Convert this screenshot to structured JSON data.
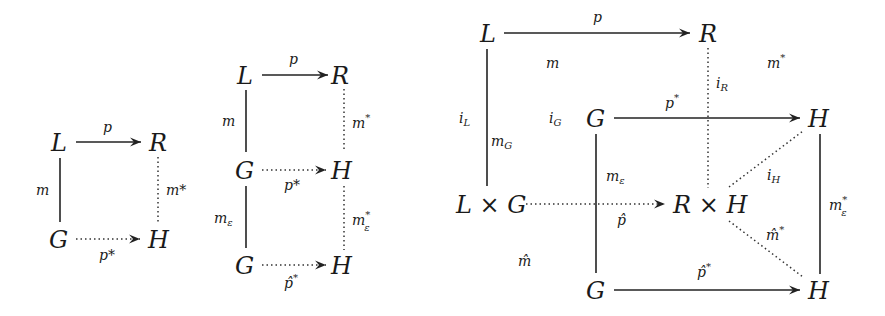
{
  "diagrams": [
    {
      "name": "pushout-square",
      "nodes": {
        "L": "L",
        "R": "R",
        "G": "G",
        "H": "H"
      },
      "labels": {
        "p": "p",
        "m": "m",
        "m_star": "m*",
        "p_star": "p*"
      }
    },
    {
      "name": "double-pushout",
      "nodes": {
        "L": "L",
        "R": "R",
        "G1": "G",
        "H1": "H",
        "G2": "G",
        "H2": "H"
      },
      "labels": {
        "p": "p",
        "m": "m",
        "m_star": "m",
        "m_star_sup": "*",
        "p_star": "p*",
        "m_eps": "m",
        "m_eps_sub": "ε",
        "m_eps_star": "m",
        "m_eps_star_sup": "*",
        "m_eps_star_sub": "ε",
        "p_hat_star": "p̂",
        "p_hat_star_sup": "*"
      }
    },
    {
      "name": "product-cube",
      "nodes": {
        "L": "L",
        "R": "R",
        "G_top": "G",
        "H_top": "H",
        "LxG": "L × G",
        "RxH": "R × H",
        "G_bot": "G",
        "H_bot": "H"
      },
      "labels": {
        "p": "p",
        "m": "m",
        "m_star": "m",
        "m_star_sup": "*",
        "i_L": "i",
        "i_L_sub": "L",
        "m_G": "m",
        "m_G_sub": "G",
        "i_G": "i",
        "i_G_sub": "G",
        "i_R": "i",
        "i_R_sub": "R",
        "p_star": "p",
        "p_star_sup": "*",
        "m_eps": "m",
        "m_eps_sub": "ε",
        "p_hat": "p̂",
        "i_H": "i",
        "i_H_sub": "H",
        "m_hat": "m̂",
        "m_hat_star": "m̂",
        "m_hat_star_sup": "*",
        "m_eps_star": "m",
        "m_eps_star_sup": "*",
        "m_eps_star_sub": "ε",
        "p_hat_star": "p̂",
        "p_hat_star_sup": "*"
      }
    }
  ]
}
